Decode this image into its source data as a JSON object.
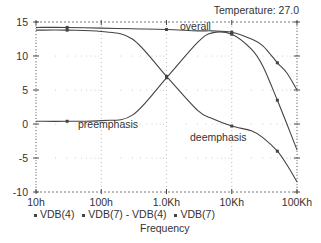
{
  "chart_data": {
    "type": "line",
    "title": "",
    "annotation_top_right": "Temperature:  27.0",
    "xlabel": "Frequency",
    "ylabel": "",
    "x_scale": "log",
    "x_ticks": [
      "10h",
      "100h",
      "1.0Kh",
      "10Kh",
      "100Kh"
    ],
    "x_tick_values": [
      10,
      100,
      1000,
      10000,
      100000
    ],
    "y_ticks": [
      "15",
      "10",
      "5",
      "0",
      "-5",
      "-10"
    ],
    "ylim": [
      -10,
      15
    ],
    "xlim": [
      10,
      100000
    ],
    "grid": true,
    "legend_position": "bottom",
    "x": [
      10,
      30,
      100,
      300,
      1000,
      3000,
      5000,
      10000,
      20000,
      30000,
      50000,
      70000,
      100000
    ],
    "series": [
      {
        "name": "VDB(4)",
        "curve_label": "deemphasis",
        "values": [
          13.8,
          13.8,
          13.6,
          12.5,
          7.0,
          2.0,
          0.8,
          -0.3,
          -1.0,
          -2.0,
          -4.0,
          -6.0,
          -8.5
        ]
      },
      {
        "name": "VDB(7) - VDB(4)",
        "curve_label": "preemphasis",
        "values": [
          0.4,
          0.4,
          0.5,
          1.3,
          6.8,
          12.0,
          13.4,
          13.2,
          11.0,
          8.5,
          3.5,
          0.0,
          -3.8
        ]
      },
      {
        "name": "VDB(7)",
        "curve_label": "overall",
        "values": [
          14.2,
          14.2,
          14.1,
          14.0,
          13.9,
          13.7,
          13.7,
          13.5,
          12.5,
          11.5,
          9.0,
          7.5,
          5.0
        ]
      }
    ],
    "curve_labels": [
      {
        "text": "overall",
        "x": 180,
        "y": 30
      },
      {
        "text": "preemphasis",
        "x": 78,
        "y": 128
      },
      {
        "text": "deemphasis",
        "x": 190,
        "y": 141
      }
    ]
  },
  "legend": [
    "VDB(4)",
    "VDB(7) - VDB(4)",
    "VDB(7)"
  ]
}
